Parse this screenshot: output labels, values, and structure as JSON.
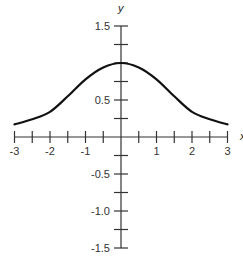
{
  "chart_data": {
    "type": "line",
    "title": "",
    "xlabel": "x",
    "ylabel": "y",
    "xlim": [
      -3,
      3
    ],
    "ylim": [
      -1.5,
      1.5
    ],
    "grid": false,
    "legend": null,
    "x_tick_labels": [
      "-3",
      "-2",
      "-1",
      "1",
      "2",
      "3"
    ],
    "y_tick_labels": [
      "1.5",
      "0.5",
      "-0.5",
      "-1.0",
      "-1.5"
    ],
    "x_minor_tick_step": 0.5,
    "y_minor_tick_step": 0.25,
    "series": [
      {
        "name": "curve",
        "x": [
          -3,
          -2.5,
          -2,
          -1.5,
          -1,
          -0.5,
          0,
          0.5,
          1,
          1.5,
          2,
          2.5,
          3
        ],
        "values": [
          0.17,
          0.24,
          0.34,
          0.55,
          0.78,
          0.94,
          1.0,
          0.94,
          0.78,
          0.55,
          0.34,
          0.24,
          0.17
        ]
      }
    ],
    "color": "#111111"
  }
}
